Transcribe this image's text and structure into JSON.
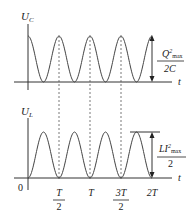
{
  "diagram": {
    "type": "lc-oscillation-energy",
    "top_plot": {
      "y_axis_label": "U",
      "y_axis_subscript": "C",
      "x_axis_label": "t",
      "amplitude_label": {
        "numerator": "Q",
        "numerator_sup": "2",
        "numerator_sub": "max",
        "denominator": "2C"
      },
      "curve": "cos^2"
    },
    "bottom_plot": {
      "y_axis_label": "U",
      "y_axis_subscript": "L",
      "x_axis_label": "t",
      "origin_label": "0",
      "amplitude_label": {
        "numerator": "LI",
        "numerator_sup": "2",
        "numerator_sub": "max",
        "denominator": "2"
      },
      "curve": "sin^2"
    },
    "x_ticks": [
      {
        "num": "T",
        "den": "2"
      },
      {
        "num": "T",
        "den": ""
      },
      {
        "num": "3T",
        "den": "2"
      },
      {
        "num": "2T",
        "den": ""
      }
    ]
  }
}
